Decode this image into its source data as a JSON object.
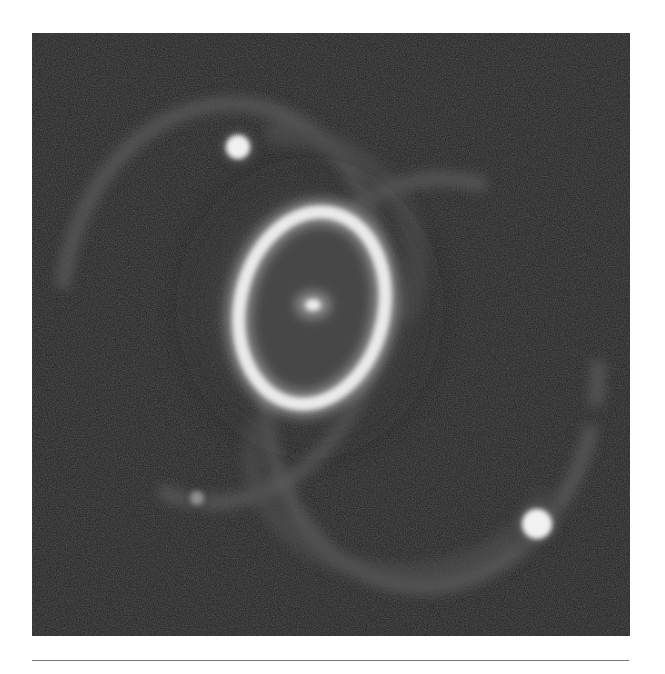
{
  "image": {
    "subject": "Supernova 1987A ring system (grayscale astronomical photograph)",
    "alt": "Bright elliptical inner ring with a central glowing spot, two faint outer loops forming an hourglass shape, and two bright foreground stars",
    "colors": {
      "background": "#1f1f1f",
      "inner_ring": "#e8e8e8",
      "ring_interior": "#4a4a4a",
      "outer_rings": "#5c5c5c",
      "stars": "#f2f2f2",
      "page": "#ffffff",
      "rule": "#777777"
    },
    "features": [
      {
        "name": "inner-ring",
        "description": "Bright elliptical equatorial ring"
      },
      {
        "name": "central-remnant",
        "description": "Small bright spot at the ring center"
      },
      {
        "name": "outer-ring-north",
        "description": "Faint upper-left loop"
      },
      {
        "name": "outer-ring-south",
        "description": "Faint lower-right loop"
      },
      {
        "name": "star-upper-left",
        "description": "Bright star near top of the northern loop"
      },
      {
        "name": "star-lower-right",
        "description": "Bright star at the lower right"
      },
      {
        "name": "star-faint-lower-left",
        "description": "Faint star at the lower left"
      }
    ]
  }
}
